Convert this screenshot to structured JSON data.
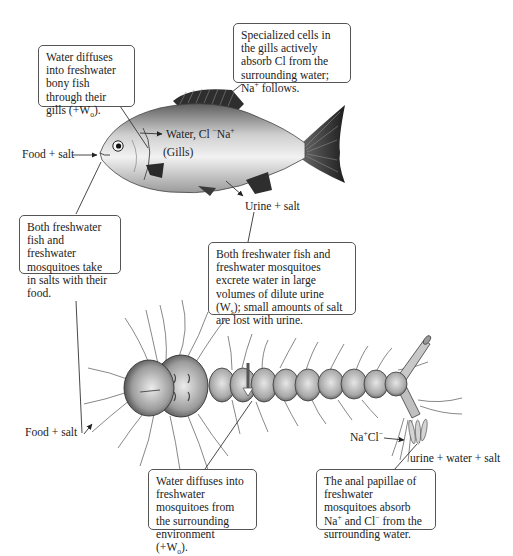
{
  "figure": {
    "organisms": [
      "freshwater bony fish",
      "freshwater mosquito larva"
    ]
  },
  "fish": {
    "labels": {
      "food_salt": "Food + salt",
      "gills_ions_prefix": "Water, Cl ",
      "gills_ions_minus": "−",
      "gills_ions_na": "Na",
      "gills_ions_plus": "+",
      "gills": "(Gills)",
      "urine_salt": "Urine + salt"
    },
    "callouts": {
      "water_diffuses": {
        "text": "Water diffuses into freshwater bony fish through their gills (+W",
        "sub": "o",
        "suffix": ")."
      },
      "specialized_cells": {
        "text": "Specialized cells in the gills actively absorb Cl from the surrounding water; Na",
        "sup": "+",
        "suffix": " follows."
      }
    }
  },
  "shared_callouts": {
    "salts_with_food": {
      "text": "Both freshwater fish and freshwater mosquitoes take in salts with their food."
    },
    "dilute_urine": {
      "text": "Both freshwater fish and freshwater mosquitoes excrete water in large volumes of dilute urine (W",
      "sub": "s",
      "suffix": "); small amounts of salt are lost with urine."
    }
  },
  "mosquito": {
    "labels": {
      "food_salt": "Food + salt",
      "na": "Na",
      "na_sup": "+",
      "cl": "Cl",
      "cl_sup": "−",
      "urine_water_salt": "urine + water + salt"
    },
    "callouts": {
      "water_diffuses": {
        "text": "Water diffuses into freshwater mosquitoes from the surrounding environment (+W",
        "sub": "o",
        "suffix": ")."
      },
      "anal_papillae": {
        "text_a": "The anal papillae of freshwater mosquitoes absorb Na",
        "sup_a": "+",
        "text_b": " and Cl",
        "sup_b": "−",
        "text_c": " from the surrounding water."
      }
    }
  },
  "colors": {
    "box_border": "#555555",
    "leader_line": "#333333",
    "fish_body_light": "#e8e8e8",
    "fish_body_dark": "#6a6a6a",
    "fin_dark": "#2e2e2e",
    "larva_body": "#b8b8b8",
    "larva_outline": "#3a3a3a"
  }
}
